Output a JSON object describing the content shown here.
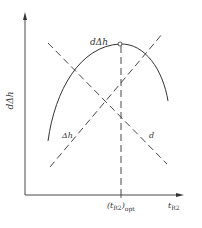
{
  "diagram": {
    "type": "line-plot-schematic",
    "colors": {
      "stroke": "#333333",
      "background": "#ffffff"
    },
    "axes": {
      "y_label": "dΔh",
      "x_label_main": "t",
      "x_label_sub": "R2",
      "x_tick_main": "(t",
      "x_tick_sub": "R2",
      "x_tick_close": ")",
      "x_tick_sub2": "opt"
    },
    "curves": [
      {
        "name": "dΔh",
        "style": "solid",
        "shape": "concave-down",
        "peak_marker": "open-circle"
      },
      {
        "name": "d",
        "style": "dashed",
        "trend": "decreasing"
      },
      {
        "name": "Δh",
        "style": "dashed",
        "trend": "increasing"
      },
      {
        "name": "optimum",
        "style": "dashed",
        "orientation": "vertical"
      }
    ],
    "labels": {
      "curve_top": "dΔh",
      "line_increasing": "Δh",
      "line_decreasing": "d"
    }
  }
}
